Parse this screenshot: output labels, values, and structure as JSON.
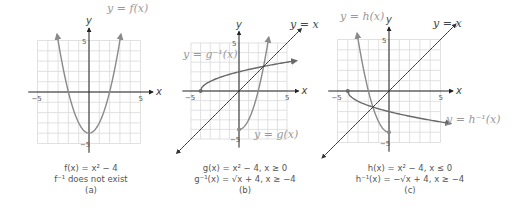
{
  "colors": {
    "grid": "#d9d9d9",
    "axis": "#222222",
    "function_curve": "#8a8a8a",
    "inverse_curve": "#6a6a6a",
    "identity_line": "#333333",
    "label_light": "#999999",
    "label_dark": "#444444"
  },
  "chart_data": [
    {
      "panel": "a",
      "type": "line",
      "xlabel": "x",
      "ylabel": "y",
      "xlim": [
        -5,
        5
      ],
      "ylim": [
        -5,
        5
      ],
      "tick_labels": {
        "x": [
          "-5",
          "5"
        ],
        "y": [
          "5",
          "-5"
        ]
      },
      "grid": true,
      "series": [
        {
          "name": "y = f(x)",
          "formula": "x^2 - 4",
          "domain": [
            -3.1,
            3.1
          ]
        }
      ],
      "caption": [
        "f(x) = x² − 4",
        "f⁻¹ does not exist",
        "(a)"
      ]
    },
    {
      "panel": "b",
      "type": "line",
      "xlabel": "x",
      "ylabel": "y",
      "xlim": [
        -5,
        5
      ],
      "ylim": [
        -5,
        5
      ],
      "tick_labels": {
        "x": [
          "-5",
          "5"
        ],
        "y": [
          "5",
          "-5"
        ]
      },
      "grid": true,
      "series": [
        {
          "name": "y = g(x)",
          "formula": "x^2 - 4",
          "domain": [
            0,
            3.1
          ],
          "endpoint": [
            0,
            -4
          ]
        },
        {
          "name": "y = g⁻¹(x)",
          "formula": "sqrt(x + 4)",
          "domain": [
            -4,
            6
          ],
          "endpoint": [
            -4,
            0
          ]
        },
        {
          "name": "y = x",
          "formula": "x",
          "domain": [
            -6.5,
            6.5
          ]
        }
      ],
      "caption": [
        "g(x) = x² − 4, x ≥ 0",
        "g⁻¹(x) = √x + 4, x ≥ −4",
        "(b)"
      ]
    },
    {
      "panel": "c",
      "type": "line",
      "xlabel": "x",
      "ylabel": "y",
      "xlim": [
        -5,
        5
      ],
      "ylim": [
        -5,
        5
      ],
      "tick_labels": {
        "x": [
          "-5",
          "5"
        ],
        "y": [
          "5",
          "-5"
        ]
      },
      "grid": true,
      "series": [
        {
          "name": "y = h(x)",
          "formula": "x^2 - 4",
          "domain": [
            -3.1,
            0
          ],
          "endpoint": [
            0,
            -4
          ]
        },
        {
          "name": "y = h⁻¹(x)",
          "formula": "-sqrt(x + 4)",
          "domain": [
            -4,
            6
          ],
          "endpoint": [
            -4,
            0
          ]
        },
        {
          "name": "y = x",
          "formula": "x",
          "domain": [
            -6.5,
            6.5
          ]
        }
      ],
      "caption": [
        "h(x) = x² − 4, x ≤ 0",
        "h⁻¹(x) = −√x + 4, x ≥ −4",
        "(c)"
      ]
    }
  ],
  "panels": {
    "a": {
      "curve_label": "y = f(x)",
      "caption_line1": "f(x) = x² − 4",
      "caption_line2": "f⁻¹ does not exist",
      "caption_tag": "(a)"
    },
    "b": {
      "curve_label": "y = g(x)",
      "inverse_label": "y = g⁻¹(x)",
      "identity_label": "y = x",
      "caption_line1": "g(x) = x² − 4, x ≥ 0",
      "caption_line2": "g⁻¹(x) = √x + 4, x ≥ −4",
      "caption_tag": "(b)"
    },
    "c": {
      "curve_label": "y = h(x)",
      "inverse_label": "y = h⁻¹(x)",
      "identity_label": "y = x",
      "caption_line1": "h(x) = x² − 4, x ≤ 0",
      "caption_line2": "h⁻¹(x) = −√x + 4, x ≥ −4",
      "caption_tag": "(c)"
    }
  }
}
